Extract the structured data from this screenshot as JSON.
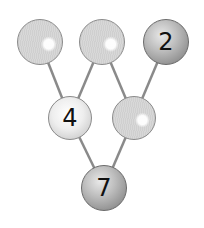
{
  "diagram": {
    "type": "number-bond-tree",
    "nodes": [
      {
        "id": "top-left",
        "value": "",
        "style": "empty"
      },
      {
        "id": "top-middle",
        "value": "",
        "style": "empty"
      },
      {
        "id": "top-right",
        "value": "2",
        "style": "dark"
      },
      {
        "id": "middle-left",
        "value": "4",
        "style": "light"
      },
      {
        "id": "middle-right",
        "value": "",
        "style": "empty"
      },
      {
        "id": "bottom",
        "value": "7",
        "style": "dark"
      }
    ],
    "edges": [
      [
        "top-left",
        "middle-left"
      ],
      [
        "top-middle",
        "middle-left"
      ],
      [
        "top-middle",
        "middle-right"
      ],
      [
        "top-right",
        "middle-right"
      ],
      [
        "middle-left",
        "bottom"
      ],
      [
        "middle-right",
        "bottom"
      ]
    ],
    "colors": {
      "line": "#8a8a8a",
      "empty_fill": "#d3d3d3",
      "light_fill": "#eeeeee",
      "dark_fill": "#9a9a9a",
      "text": "#111111"
    }
  }
}
